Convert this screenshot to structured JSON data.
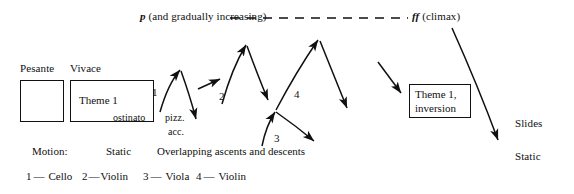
{
  "figure": {
    "type": "music-form-diagram",
    "top_annotation": {
      "dynamic": "p",
      "text": " (and gradually increasing)",
      "dash_line": "- - - - - - - - - - - -"
    },
    "climax": {
      "dynamic": "ff",
      "text": " (climax)"
    },
    "sections": [
      {
        "tempo_label": "Pesante",
        "box_text": ""
      },
      {
        "tempo_label": "Vivace",
        "box_text": "Theme 1"
      }
    ],
    "inversion_box": {
      "line1": "Theme 1,",
      "line2": "inversion"
    },
    "inline_labels": {
      "ostinato": "ostinato",
      "pizz": "pizz.",
      "acc": "acc."
    },
    "voice_numbers": [
      "1",
      "2",
      "3",
      "4"
    ],
    "right_labels": {
      "slides": "Slides",
      "static": "Static"
    },
    "motion_row": {
      "title": "Motion:",
      "static": "Static",
      "overlapping": "Overlapping ascents and descents"
    },
    "instrument_key": [
      {
        "number": "1",
        "dash": "—",
        "instrument": "Cello"
      },
      {
        "number": "2",
        "dash": "—",
        "instrument": "Violin"
      },
      {
        "number": "3",
        "dash": "—",
        "instrument": "Viola"
      },
      {
        "number": "4",
        "dash": "—",
        "instrument": "Violin"
      }
    ],
    "colors": {
      "ink": "#101010",
      "background": "#ffffff"
    }
  }
}
